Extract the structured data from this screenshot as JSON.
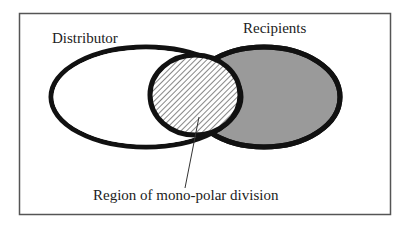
{
  "diagram": {
    "type": "venn",
    "labels": {
      "left_set": "Distributor",
      "right_set": "Recipients",
      "callout": "Region of mono-polar division"
    },
    "colors": {
      "background": "#ffffff",
      "frame": "#555555",
      "outline": "#111111",
      "recipients_fill": "#9a9a9a",
      "hatch_fill": "#ffffff",
      "hatch_line": "#7a7a7a",
      "leader_line": "#333333"
    }
  }
}
